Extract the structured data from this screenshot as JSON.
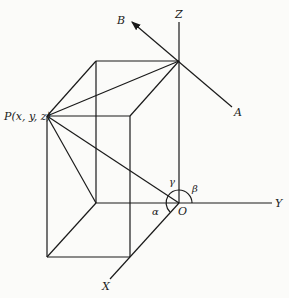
{
  "diagram": {
    "labels": {
      "point_p": "P(x, y, z)",
      "axis_x": "X",
      "axis_y": "Y",
      "axis_z": "Z",
      "origin": "O",
      "line_end_a": "A",
      "line_end_b": "B",
      "angle_alpha": "α",
      "angle_beta": "β",
      "angle_gamma": "γ"
    },
    "line_color": "#1a1a1a",
    "background_color": "#fbfbf9"
  }
}
